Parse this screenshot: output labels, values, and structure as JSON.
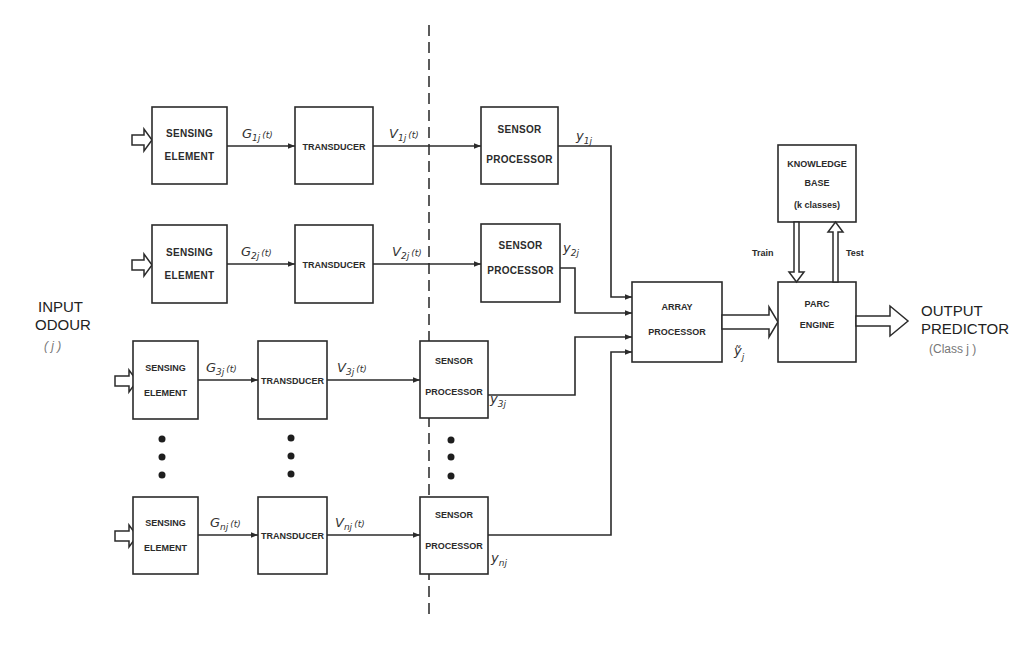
{
  "diagram": {
    "input": {
      "line1": "INPUT",
      "line2": "ODOUR",
      "index": "( j )"
    },
    "output": {
      "line1": "OUTPUT",
      "line2": "PREDICTOR",
      "class": "(Class j )"
    },
    "rows": [
      {
        "sensing": [
          "SENSING",
          "ELEMENT"
        ],
        "g": "G",
        "g_sub": "1j",
        "transducer": "TRANSDUCER",
        "v": "V",
        "v_sub": "1j",
        "sensor": [
          "SENSOR",
          "PROCESSOR"
        ],
        "y": "y",
        "y_sub": "1j",
        "t": "(t)"
      },
      {
        "sensing": [
          "SENSING",
          "ELEMENT"
        ],
        "g": "G",
        "g_sub": "2j",
        "transducer": "TRANSDUCER",
        "v": "V",
        "v_sub": "2j",
        "sensor": [
          "SENSOR",
          "PROCESSOR"
        ],
        "y": "y",
        "y_sub": "2j",
        "t": "(t)"
      },
      {
        "sensing": [
          "SENSING",
          "ELEMENT"
        ],
        "g": "G",
        "g_sub": "3j",
        "transducer": "TRANSDUCER",
        "v": "V",
        "v_sub": "3j",
        "sensor": [
          "SENSOR",
          "PROCESSOR"
        ],
        "y": "y",
        "y_sub": "3j",
        "t": "(t)"
      },
      {
        "sensing": [
          "SENSING",
          "ELEMENT"
        ],
        "g": "G",
        "g_sub": "nj",
        "transducer": "TRANSDUCER",
        "v": "V",
        "v_sub": "nj",
        "sensor": [
          "SENSOR",
          "PROCESSOR"
        ],
        "y": "y",
        "y_sub": "nj",
        "t": "(t)"
      }
    ],
    "array_processor": [
      "ARRAY",
      "PROCESSOR"
    ],
    "array_output": {
      "symbol": "ỹ",
      "sub": "j"
    },
    "parc_engine": [
      "PARC",
      "ENGINE"
    ],
    "knowledge_base": [
      "KNOWLEDGE",
      "BASE",
      "(k classes)"
    ],
    "train_label": "Train",
    "test_label": "Test"
  }
}
